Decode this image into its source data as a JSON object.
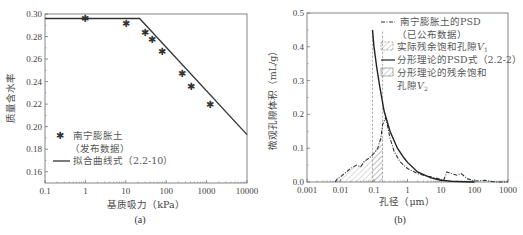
{
  "chart_data": [
    {
      "type": "line",
      "panel_label": "(a)",
      "xlabel": "基质吸力（kPa）",
      "ylabel": "质量含水率",
      "xscale": "log",
      "xlim": [
        0.1,
        10000
      ],
      "ylim": [
        0.15,
        0.3
      ],
      "xticks": [
        "0.1",
        "1",
        "10",
        "100",
        "1000",
        "10000"
      ],
      "xtick_values": [
        0.1,
        1,
        10,
        100,
        1000,
        10000
      ],
      "yticks": [
        "0.16",
        "0.18",
        "0.20",
        "0.22",
        "0.24",
        "0.26",
        "0.28",
        "0.30"
      ],
      "ytick_values": [
        0.16,
        0.18,
        0.2,
        0.22,
        0.24,
        0.26,
        0.28,
        0.3
      ],
      "legend_position": "bottom-left",
      "series": [
        {
          "name": "南宁膨胀土（发布数据）",
          "legend_lines": [
            "南宁膨胀土",
            "（发布数据）"
          ],
          "kind": "scatter",
          "marker": "star",
          "x": [
            1,
            10,
            30,
            45,
            80,
            250,
            400,
            1200
          ],
          "y": [
            0.296,
            0.292,
            0.284,
            0.277,
            0.267,
            0.247,
            0.236,
            0.22
          ]
        },
        {
          "name": "拟合曲线式（2.2-10）",
          "legend_lines": [
            "拟合曲线式（2.2-10）"
          ],
          "kind": "line",
          "x": [
            0.1,
            22,
            10000
          ],
          "y": [
            0.296,
            0.296,
            0.193
          ]
        }
      ]
    },
    {
      "type": "line",
      "panel_label": "(b)",
      "xlabel": "孔径（μm）",
      "ylabel": "微观孔隙体积（mL/g）",
      "xscale": "log",
      "xlim": [
        0.001,
        1000
      ],
      "ylim": [
        0.0,
        0.5
      ],
      "xticks": [
        "0.001",
        "0.01",
        "0.1",
        "1",
        "10",
        "100",
        "1000"
      ],
      "xtick_values": [
        0.001,
        0.01,
        0.1,
        1,
        10,
        100,
        1000
      ],
      "yticks": [
        "0.0",
        "0.1",
        "0.2",
        "0.3",
        "0.4",
        "0.5"
      ],
      "ytick_values": [
        0.0,
        0.1,
        0.2,
        0.3,
        0.4,
        0.5
      ],
      "legend_position": "top-right",
      "series": [
        {
          "name": "南宁膨胀土的PSD（已公布数据）",
          "legend_lines": [
            "南宁膨胀土的PSD",
            "（已公布数据）"
          ],
          "kind": "dashdot",
          "x": [
            0.007,
            0.008,
            0.01,
            0.015,
            0.02,
            0.03,
            0.04,
            0.05,
            0.07,
            0.1,
            0.13,
            0.16,
            0.18,
            0.2,
            0.22,
            0.25,
            0.3,
            0.4,
            0.6,
            1,
            2,
            3,
            5,
            8,
            12,
            15,
            20,
            30,
            40,
            60,
            100,
            200,
            400,
            1000
          ],
          "y": [
            0.0,
            0.01,
            0.015,
            0.03,
            0.04,
            0.05,
            0.045,
            0.06,
            0.07,
            0.085,
            0.1,
            0.13,
            0.17,
            0.18,
            0.19,
            0.17,
            0.13,
            0.09,
            0.06,
            0.04,
            0.025,
            0.02,
            0.015,
            0.01,
            0.005,
            0.03,
            0.025,
            0.02,
            0.025,
            0.01,
            0.003,
            0.005,
            0.0,
            0.0
          ]
        },
        {
          "name": "分形理论的PSD式（2.2-2）",
          "legend_lines": [
            "分形理论的PSD式（2.2-2）"
          ],
          "kind": "line",
          "x": [
            0.09,
            0.1,
            0.12,
            0.15,
            0.2,
            0.3,
            0.5,
            0.8,
            1,
            2,
            5,
            10,
            20,
            50,
            100
          ],
          "y": [
            0.45,
            0.4,
            0.34,
            0.28,
            0.21,
            0.15,
            0.1,
            0.07,
            0.058,
            0.03,
            0.012,
            0.005,
            0.002,
            0.001,
            0.0
          ]
        }
      ],
      "shaded_regions": [
        {
          "name": "实际残余饱和孔隙V1",
          "legend_label": "实际残余饱和孔隙",
          "legend_var": "V",
          "legend_sub": "1",
          "pattern": "dashed-border-hatch",
          "x_range": [
            0.007,
            0.18
          ]
        },
        {
          "name": "分形理论的残余饱和孔隙V2",
          "legend_lines": [
            "分形理论的残余饱和",
            "孔隙"
          ],
          "legend_var": "V",
          "legend_sub": "2",
          "pattern": "hatch",
          "x_range": [
            0.09,
            0.18
          ]
        }
      ],
      "vertical_guides": [
        0.09,
        0.18
      ]
    }
  ]
}
